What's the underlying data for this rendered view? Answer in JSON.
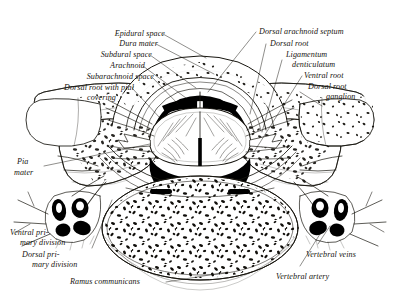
{
  "figure": {
    "style": "engraved line illustration, black ink on white",
    "colors": {
      "ink": "#17150f",
      "paper": "#ffffff",
      "cord_fill": "#ffffff",
      "vessel_lumen": "#000000",
      "subarachnoid_dark": "#000000"
    }
  },
  "labels": [
    {
      "id": "epidural-space",
      "text": "Epidural space",
      "align": "right"
    },
    {
      "id": "dura-mater",
      "text": "Dura mater",
      "align": "right"
    },
    {
      "id": "subdural-space",
      "text": "Subdural space",
      "align": "right"
    },
    {
      "id": "arachnoid",
      "text": "Arachnoid",
      "align": "right"
    },
    {
      "id": "subarachnoid-space",
      "text": "Subarachnoid space",
      "align": "right"
    },
    {
      "id": "dorsal-root-pial",
      "text": "Dorsal root with pial",
      "align": "right"
    },
    {
      "id": "dorsal-root-pial-2",
      "text": "covering",
      "align": "right"
    },
    {
      "id": "dorsal-arachnoid-septum",
      "text": "Dorsal arachnoid septum",
      "align": "left"
    },
    {
      "id": "dorsal-root",
      "text": "Dorsal root",
      "align": "left"
    },
    {
      "id": "ligamentum",
      "text": "Ligamentum",
      "align": "left"
    },
    {
      "id": "ligamentum-2",
      "text": "denticulatum",
      "align": "left"
    },
    {
      "id": "ventral-root",
      "text": "Ventral root",
      "align": "left"
    },
    {
      "id": "dorsal-root-ganglion",
      "text": "Dorsal root",
      "align": "left"
    },
    {
      "id": "dorsal-root-ganglion-2",
      "text": "ganglion",
      "align": "left"
    },
    {
      "id": "pia-mater",
      "text": "Pia",
      "align": "left"
    },
    {
      "id": "pia-mater-2",
      "text": "mater",
      "align": "left"
    },
    {
      "id": "ventral-primary",
      "text": "Ventral pri-",
      "align": "left"
    },
    {
      "id": "ventral-primary-2",
      "text": "mary division",
      "align": "left"
    },
    {
      "id": "dorsal-primary",
      "text": "Dorsal pri-",
      "align": "left"
    },
    {
      "id": "dorsal-primary-2",
      "text": "mary division",
      "align": "left"
    },
    {
      "id": "ramus-communicans",
      "text": "Ramus communicans",
      "align": "left"
    },
    {
      "id": "vertebral-veins",
      "text": "Vertebral veins",
      "align": "left"
    },
    {
      "id": "vertebral-artery",
      "text": "Vertebral artery",
      "align": "left"
    }
  ],
  "structures": [
    {
      "id": "spinal-cord",
      "name": "spinal cord"
    },
    {
      "id": "vertebral-body",
      "name": "vertebral body with cancellous bone"
    },
    {
      "id": "transverse-process-left",
      "name": "left transverse process"
    },
    {
      "id": "transverse-process-right",
      "name": "right transverse process"
    },
    {
      "id": "lamina-left",
      "name": "left lamina"
    },
    {
      "id": "lamina-right",
      "name": "right lamina"
    },
    {
      "id": "ganglion-left",
      "name": "left dorsal root ganglion"
    },
    {
      "id": "ganglion-right",
      "name": "right dorsal root ganglion"
    },
    {
      "id": "vessel-cluster-left",
      "name": "left vertebral artery and veins"
    },
    {
      "id": "vessel-cluster-right",
      "name": "right vertebral artery and veins"
    }
  ]
}
